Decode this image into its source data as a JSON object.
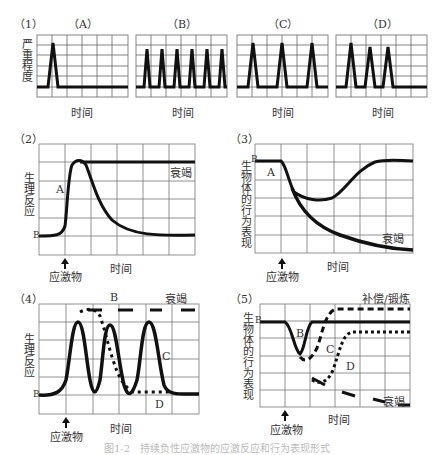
{
  "figure": {
    "caption": "图1-2　持续负性应激物的应激反应和行为表现形式",
    "panel1": {
      "label": "（1）",
      "ylabel": "严重程度",
      "xlabel": "时间",
      "subpanels": [
        {
          "label": "（A）",
          "peaks": 1
        },
        {
          "label": "（B）",
          "peaks": 6
        },
        {
          "label": "（C）",
          "peaks": 3
        },
        {
          "label": "（D）",
          "peaks": 3
        }
      ]
    },
    "panel2": {
      "label": "（2）",
      "ylabel": "生理反应",
      "xlabel": "时间",
      "stimulus": "应激物",
      "baseline": "B",
      "curve_a": "A",
      "exhaustion": "衰竭"
    },
    "panel3": {
      "label": "（3）",
      "ylabel": "生物体的行为表现",
      "xlabel": "时间",
      "stimulus": "应激物",
      "baseline": "B",
      "curve_a": "A",
      "exhaustion": "衰竭"
    },
    "panel4": {
      "label": "（4）",
      "ylabel": "生理反应",
      "xlabel": "时间",
      "stimulus": "应激物",
      "baseline": "B",
      "curve_b": "B",
      "curve_c": "C",
      "curve_d": "D",
      "exhaustion": "衰竭"
    },
    "panel5": {
      "label": "（5）",
      "ylabel": "生物体的行为表现",
      "xlabel": "时间",
      "stimulus": "应激物",
      "baseline": "B",
      "curve_b": "B",
      "curve_c": "C",
      "curve_d": "D",
      "compensation": "补偿/锻炼",
      "exhaustion": "衰竭"
    }
  }
}
